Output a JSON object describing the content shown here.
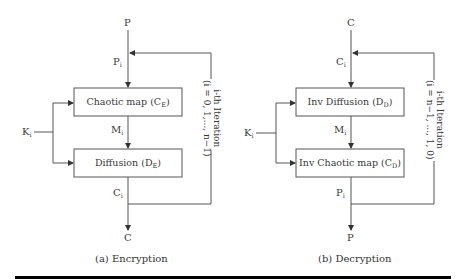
{
  "encryption": {
    "input": "P",
    "round_input": {
      "base": "P",
      "sub": "i"
    },
    "block1": {
      "name": "Chaotic map",
      "sym": "C",
      "sub": "E"
    },
    "middle": {
      "base": "M",
      "sub": "i"
    },
    "block2": {
      "name": "Diffusion",
      "sym": "D",
      "sub": "E"
    },
    "round_output": {
      "base": "C",
      "sub": "i"
    },
    "output": "C",
    "key": {
      "base": "K",
      "sub": "i"
    },
    "iteration_line1": "i-th Iteration",
    "iteration_line2": "(i = 0, 1,..., n−1)",
    "caption": "(a) Encryption"
  },
  "decryption": {
    "input": "C",
    "round_input": {
      "base": "C",
      "sub": "i"
    },
    "block1": {
      "name": "Inv Diffusion",
      "sym": "D",
      "sub": "D"
    },
    "middle": {
      "base": "M",
      "sub": "i"
    },
    "block2": {
      "name": "Inv Chaotic map",
      "sym": "C",
      "sub": "D"
    },
    "round_output": {
      "base": "P",
      "sub": "i"
    },
    "output": "P",
    "key": {
      "base": "K",
      "sub": "i"
    },
    "iteration_line1": "i-th Iteration",
    "iteration_line2": "(i = n−1, ..., 1, 0)",
    "caption": "(b) Decryption"
  },
  "colors": {
    "line": "#4a4a4a",
    "rule": "#000000"
  }
}
